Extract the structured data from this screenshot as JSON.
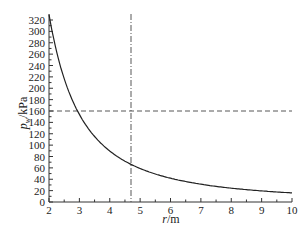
{
  "chart_data": {
    "type": "line",
    "title": "",
    "xlabel": "r/m",
    "xlabel_italic": "r",
    "xlabel_unit": "/m",
    "ylabel": "p_w/kPa",
    "ylabel_main": "p",
    "ylabel_sub": "w",
    "ylabel_unit": "/kPa",
    "xlim": [
      2,
      10
    ],
    "ylim": [
      0,
      330
    ],
    "xticks": [
      2,
      3,
      4,
      5,
      6,
      7,
      8,
      9,
      10
    ],
    "yticks": [
      0,
      20,
      40,
      60,
      80,
      100,
      120,
      140,
      160,
      180,
      200,
      220,
      240,
      260,
      280,
      300,
      320
    ],
    "grid": false,
    "legend": null,
    "series": [
      {
        "name": "p_w",
        "style": "solid",
        "x": [
          2.0,
          2.25,
          2.5,
          2.75,
          3.0,
          3.5,
          4.0,
          4.5,
          4.7,
          5.0,
          5.5,
          6.0,
          7.0,
          8.0,
          9.0,
          10.0
        ],
        "values": [
          330,
          293,
          264,
          240,
          220,
          189,
          165,
          147,
          140,
          132,
          120,
          110,
          94,
          83,
          73,
          66
        ]
      }
    ],
    "reference_lines": [
      {
        "orientation": "horizontal",
        "value": 160,
        "style": "dashed"
      },
      {
        "orientation": "vertical",
        "value": 4.7,
        "style": "dash-dot"
      }
    ],
    "colors": {
      "curve": "#222222",
      "axis": "#333333",
      "ref": "#444444"
    }
  }
}
